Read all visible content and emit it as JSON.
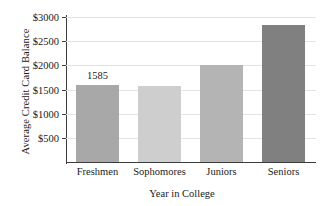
{
  "chart_data": {
    "type": "bar",
    "title": "",
    "xlabel": "Year in College",
    "ylabel": "Average Credit Card Balance",
    "categories": [
      "Freshmen",
      "Sophomores",
      "Juniors",
      "Seniors"
    ],
    "values": [
      1585,
      1565,
      2000,
      2825
    ],
    "bar_colors": [
      "#a8a8a8",
      "#cecece",
      "#b4b4b4",
      "#808080"
    ],
    "data_labels": [
      "1585",
      "",
      "",
      ""
    ],
    "ylim": [
      0,
      3000
    ],
    "yticks": [
      500,
      1000,
      1500,
      2000,
      2500,
      3000
    ],
    "ytick_labels": [
      "$500",
      "$1000",
      "$1500",
      "$2000",
      "$2500",
      "$3000"
    ],
    "grid": true,
    "legend": false
  }
}
